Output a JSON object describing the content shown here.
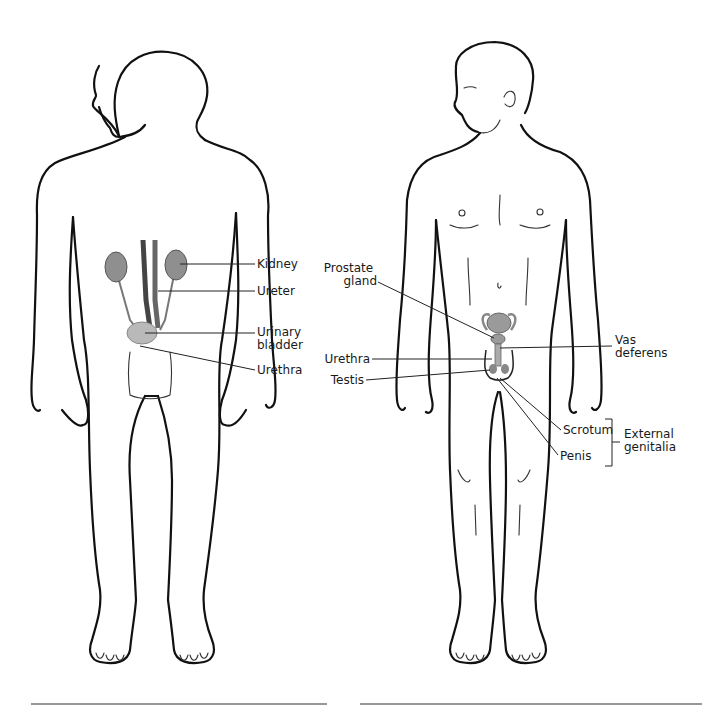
{
  "figures": {
    "left": {
      "title": "Urinary system figure",
      "labels": [
        {
          "id": "kidney",
          "text": [
            "Kidney"
          ]
        },
        {
          "id": "ureter",
          "text": [
            "Ureter"
          ]
        },
        {
          "id": "urinary-bladder",
          "text": [
            "Urinary",
            "bladder"
          ]
        },
        {
          "id": "urethra",
          "text": [
            "Urethra"
          ]
        }
      ]
    },
    "right": {
      "title": "Male reproductive system figure",
      "labels": [
        {
          "id": "prostate-gland",
          "text": [
            "Prostate",
            "gland"
          ]
        },
        {
          "id": "vas-deferens",
          "text": [
            "Vas",
            "deferens"
          ]
        },
        {
          "id": "urethra",
          "text": [
            "Urethra"
          ]
        },
        {
          "id": "testis",
          "text": [
            "Testis"
          ]
        },
        {
          "id": "scrotum",
          "text": [
            "Scrotum"
          ]
        },
        {
          "id": "penis",
          "text": [
            "Penis"
          ]
        },
        {
          "id": "external-genitalia",
          "text": [
            "External",
            "genitalia"
          ]
        }
      ]
    }
  },
  "colors": {
    "outline": "#111111",
    "organ_fill": "#8f8f8f",
    "bladder_fill": "#b9b9b9",
    "background": "#ffffff"
  }
}
